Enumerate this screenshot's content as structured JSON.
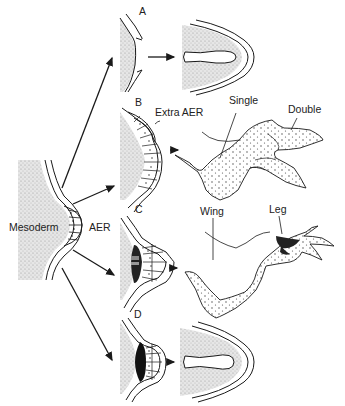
{
  "diagram": {
    "type": "limb-bud AER grafting experiment",
    "source_labels": {
      "mesoderm": "Mesoderm",
      "aer": "AER"
    },
    "panels": [
      {
        "id": "A",
        "label": "A",
        "outcome": "truncated limb (no AER)"
      },
      {
        "id": "B",
        "label": "B",
        "annotation": "Extra AER",
        "outcome_labels": [
          "Single",
          "Double"
        ]
      },
      {
        "id": "C",
        "label": "C",
        "outcome_labels": [
          "Wing",
          "Leg"
        ]
      },
      {
        "id": "D",
        "label": "D",
        "outcome": "truncated limb"
      }
    ],
    "colors": {
      "ink": "#1a1a1a",
      "stipple": "#cfcfcf",
      "background": "#ffffff"
    }
  }
}
